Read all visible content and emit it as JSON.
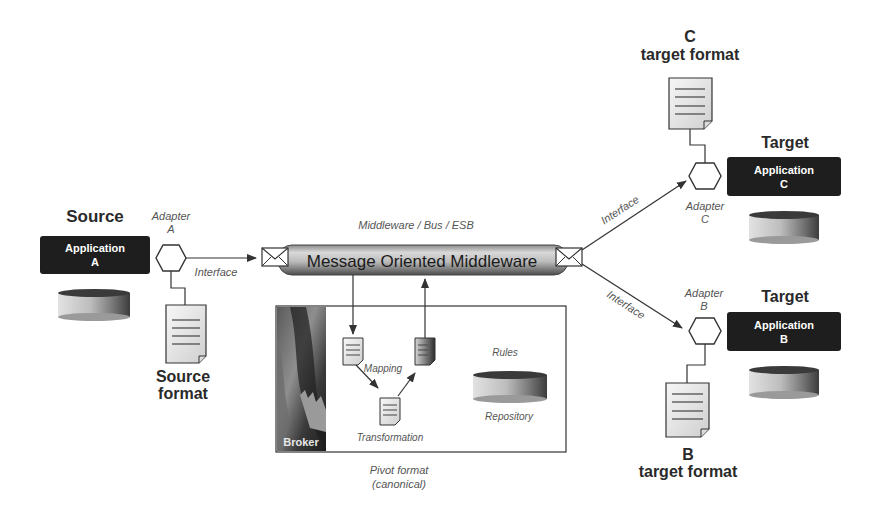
{
  "diagram": {
    "middleware": {
      "caption": "Middleware / Bus / ESB",
      "label": "Message Oriented Middleware"
    },
    "source": {
      "title": "Source",
      "app_line1": "Application",
      "app_line2": "A",
      "adapter_line1": "Adapter",
      "adapter_line2": "A",
      "interface_label": "Interface",
      "format_line1": "Source",
      "format_line2": "format"
    },
    "target_c": {
      "title": "Target",
      "app_line1": "Application",
      "app_line2": "C",
      "adapter_line1": "Adapter",
      "adapter_line2": "C",
      "interface_label": "Interface",
      "format_line1": "C",
      "format_line2": "target format"
    },
    "target_b": {
      "title": "Target",
      "app_line1": "Application",
      "app_line2": "B",
      "adapter_line1": "Adapter",
      "adapter_line2": "B",
      "interface_label": "Interface",
      "format_line1": "B",
      "format_line2": "target format"
    },
    "broker": {
      "label": "Broker",
      "mapping_label": "Mapping",
      "transformation_label": "Transformation",
      "rules_label": "Rules",
      "repository_label": "Repository",
      "pivot_line1": "Pivot format",
      "pivot_line2": "(canonical)"
    },
    "colors": {
      "app_box": "#1e1e1e",
      "app_text": "#ffffff",
      "pipe_light": "#d8d8d8",
      "pipe_dark": "#6a6a6a",
      "line": "#333333",
      "db_light": "#dcdcdc",
      "db_dark": "#3a3a3a"
    }
  }
}
